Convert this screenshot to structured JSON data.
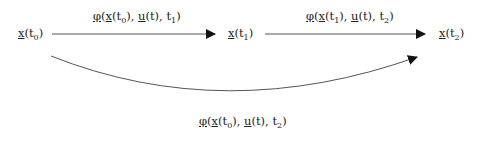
{
  "diagram": {
    "type": "state-transition",
    "nodes": [
      {
        "id": "x_t0",
        "var": "x",
        "sub": "0",
        "label": "x(t0)"
      },
      {
        "id": "x_t1",
        "var": "x",
        "sub": "1",
        "label": "x(t1)"
      },
      {
        "id": "x_t2",
        "var": "x",
        "sub": "2",
        "label": "x(t2)"
      }
    ],
    "edges": [
      {
        "from": "x_t0",
        "to": "x_t1",
        "fn": "φ",
        "x_sub": "0",
        "u": "u",
        "t_end_sub": "1",
        "label": "φ(x(t0), u(t), t1)",
        "style": "straight"
      },
      {
        "from": "x_t1",
        "to": "x_t2",
        "fn": "φ",
        "x_sub": "1",
        "u": "u",
        "t_end_sub": "2",
        "label": "φ(x(t1), u(t), t2)",
        "style": "straight"
      },
      {
        "from": "x_t0",
        "to": "x_t2",
        "fn": "φ",
        "x_sub": "0",
        "u": "u",
        "t_end_sub": "2",
        "label": "φ(x(t0), u(t), t2)",
        "style": "curved"
      }
    ],
    "colors": {
      "line": "#555555",
      "arrowhead": "#111111",
      "text": "#222222"
    }
  }
}
